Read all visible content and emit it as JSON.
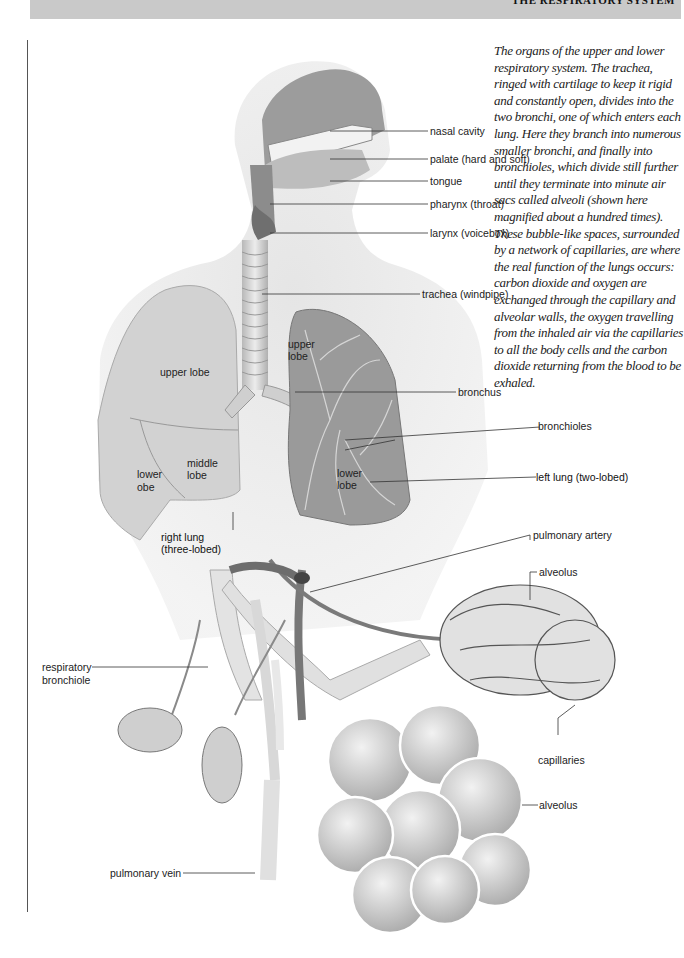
{
  "header": {
    "title": "The Respiratory System"
  },
  "caption": "The organs of the upper and lower respiratory system. The trachea, ringed with cartilage to keep it rigid and constantly open, divides into the two bronchi, one of which enters each lung. Here they branch into numerous smaller bronchi, and finally into bronchioles, which divide still further until they terminate into minute air sacs called alveoli (shown here magnified about a hundred times). These bubble-like spaces, surrounded by a network of capillaries, are where the real function of the lungs occurs: carbon dioxide and oxygen are exchanged through the capillary and alveolar walls, the oxygen travelling from the inhaled air via the capillaries to all the body cells and the carbon dioxide returning from the blood to be exhaled.",
  "labels": {
    "nasal_cavity": "nasal cavity",
    "palate": "palate (hard and soft)",
    "tongue": "tongue",
    "pharynx": "pharynx (throat)",
    "larynx": "larynx (voicebox)",
    "trachea": "trachea (windpipe)",
    "upper_lobe_right": "upper lobe",
    "upper_lobe_left_1": "upper",
    "upper_lobe_left_2": "lobe",
    "bronchus": "bronchus",
    "bronchioles": "bronchioles",
    "middle_lobe_1": "middle",
    "middle_lobe_2": "lobe",
    "lower_lobe_right_1": "lower",
    "lower_lobe_right_2": "obe",
    "lower_lobe_left_1": "lower",
    "lower_lobe_left_2": "lobe",
    "left_lung": "left lung  (two-lobed)",
    "right_lung_1": "right lung",
    "right_lung_2": "(three-lobed)",
    "pulmonary_artery": "pulmonary artery",
    "alveolus_top": "alveolus",
    "respiratory_bronchiole_1": "respiratory",
    "respiratory_bronchiole_2": "bronchiole",
    "capillaries": "capillaries",
    "alveolus_bottom": "alveolus",
    "pulmonary_vein": "pulmonary   vein"
  },
  "colors": {
    "header_bar": "#c9c9c9",
    "body_silhouette": "#e6e6e6",
    "lung_right": "#cfcfcf",
    "lung_left": "#9a9a9a",
    "vessel_dark": "#6e6e6e",
    "vessel_light": "#dcdcdc",
    "leader_line": "#333333"
  }
}
